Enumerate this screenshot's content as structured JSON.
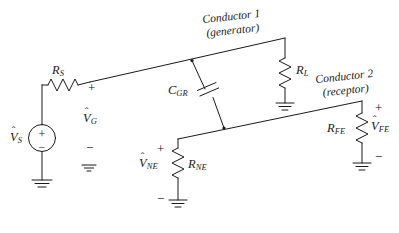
{
  "figure": {
    "background_color": "#ffffff",
    "line_color": "#1a1a1a",
    "text_color": "#1a1a1a",
    "width": 399,
    "height": 233
  },
  "labels": {
    "source_voltage": {
      "base": "V",
      "sub": "S",
      "hat": "ˆ"
    },
    "source_resistor": {
      "base": "R",
      "sub": "S"
    },
    "generator_voltage": {
      "base": "V",
      "sub": "G",
      "hat": "ˆ"
    },
    "coupling_capacitor": {
      "base": "C",
      "sub": "GR"
    },
    "load_resistor": {
      "base": "R",
      "sub": "L"
    },
    "near_end_voltage": {
      "base": "V",
      "sub": "NE",
      "hat": "ˆ"
    },
    "near_end_resistor": {
      "base": "R",
      "sub": "NE"
    },
    "far_end_resistor": {
      "base": "R",
      "sub": "FE"
    },
    "far_end_voltage": {
      "base": "V",
      "sub": "FE",
      "hat": "ˆ"
    }
  },
  "annotations": {
    "conductor1_line1": "Conductor 1",
    "conductor1_line2": "(generator)",
    "conductor2_line1": "Conductor 2",
    "conductor2_line2": "(receptor)"
  },
  "polarity": {
    "generator_plus": "+",
    "generator_minus": "−",
    "near_end_plus": "+",
    "near_end_minus": "−",
    "far_end_plus": "+",
    "far_end_minus": "−",
    "source_plus": "+",
    "source_minus": "−"
  },
  "components": [
    {
      "name": "source",
      "type": "independent-voltage-source",
      "label": "V_S"
    },
    {
      "name": "source-resistor",
      "type": "resistor",
      "label": "R_S"
    },
    {
      "name": "coupling-capacitor",
      "type": "capacitor",
      "label": "C_GR"
    },
    {
      "name": "load-resistor",
      "type": "resistor",
      "label": "R_L"
    },
    {
      "name": "near-end-resistor",
      "type": "resistor",
      "label": "R_NE"
    },
    {
      "name": "far-end-resistor",
      "type": "resistor",
      "label": "R_FE"
    },
    {
      "name": "ground-source",
      "type": "ground"
    },
    {
      "name": "ground-generator-reference",
      "type": "ground"
    },
    {
      "name": "ground-load",
      "type": "ground"
    },
    {
      "name": "ground-near-end",
      "type": "ground"
    },
    {
      "name": "ground-far-end",
      "type": "ground"
    }
  ]
}
